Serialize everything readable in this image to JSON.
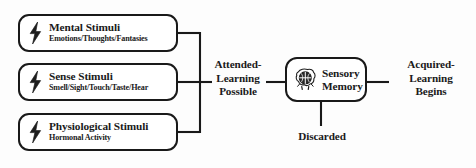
{
  "diagram": {
    "colors": {
      "stroke": "#191919",
      "background": "#fdfdfd",
      "text": "#1a1a1a"
    },
    "stimuli": [
      {
        "icon": "lightning-bolt-icon",
        "title": "Mental Stimuli",
        "subtitle": "Emotions/Thoughts/Fantasies"
      },
      {
        "icon": "lightning-bolt-icon",
        "title": "Sense Stimuli",
        "subtitle": "Smell/Sight/Touch/Taste/Hear"
      },
      {
        "icon": "lightning-bolt-icon",
        "title": "Physiological Stimuli",
        "subtitle": "Hormonal Activity"
      }
    ],
    "attended_label": "Attended-\nLearning\nPossible",
    "sensory_memory": {
      "icon": "brain-head-icon",
      "label": "Sensory\nMemory"
    },
    "acquired_label": "Acquired-\nLearning\nBegins",
    "discarded_label": "Discarded"
  }
}
